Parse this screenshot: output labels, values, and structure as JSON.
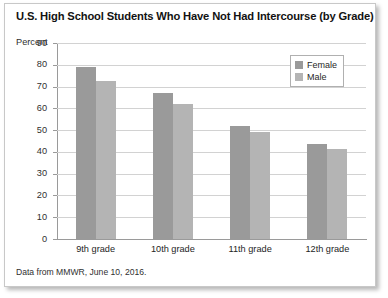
{
  "figure": {
    "title": "U.S. High School Students Who Have Not Had Intercourse (by Grade)",
    "source_note": "Data from MMWR, June 10, 2016.",
    "axis_unit_label": "Percent"
  },
  "legend": {
    "position": "top-right",
    "entries": [
      {
        "label": "Female",
        "color": "#9a9a9a"
      },
      {
        "label": "Male",
        "color": "#b4b4b4"
      }
    ]
  },
  "chart_data": {
    "type": "bar",
    "title": "U.S. High School Students Who Have Not Had Intercourse (by Grade)",
    "xlabel": "",
    "ylabel": "Percent",
    "ylim": [
      0,
      90
    ],
    "yticks": [
      0,
      10,
      20,
      30,
      40,
      50,
      60,
      70,
      80,
      90
    ],
    "ytick_labels": [
      "0",
      "10",
      "20",
      "30",
      "40",
      "50",
      "60",
      "70",
      "80",
      "90"
    ],
    "grid": true,
    "grid_axis": "y",
    "legend_position": "top-right",
    "categories": [
      "9th grade",
      "10th grade",
      "11th grade",
      "12th grade"
    ],
    "series": [
      {
        "name": "Female",
        "color": "#9a9a9a",
        "values": [
          79,
          67,
          52,
          43.5
        ]
      },
      {
        "name": "Male",
        "color": "#b4b4b4",
        "values": [
          72.5,
          62,
          49,
          41.5
        ]
      }
    ]
  }
}
